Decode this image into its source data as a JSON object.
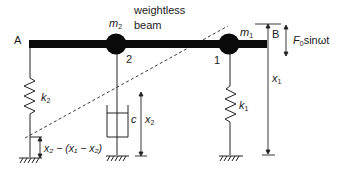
{
  "diagram": {
    "labels": {
      "point_a": "A",
      "point_b": "B",
      "beam_line1": "weightless",
      "beam_line2": "beam",
      "node_1": "1",
      "node_2": "2",
      "mass_1": {
        "sym": "m",
        "sub": "1"
      },
      "mass_2": {
        "sym": "m",
        "sub": "2"
      },
      "spring_1": {
        "sym": "k",
        "sub": "1"
      },
      "spring_2": {
        "sym": "k",
        "sub": "2"
      },
      "damper": "c",
      "disp_1": {
        "sym": "x",
        "sub": "1"
      },
      "disp_2": {
        "sym": "x",
        "sub": "2"
      },
      "force": {
        "sym": "F",
        "sub": "0",
        "rest": "sinωt"
      },
      "spring2_deflection": "x₂ − (x₁ − x₂)"
    },
    "colors": {
      "ink": "#111111",
      "beam": "#0a0a0a",
      "background": "#ffffff"
    }
  }
}
